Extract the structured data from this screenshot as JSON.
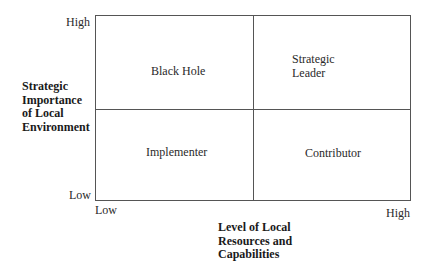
{
  "y_axis": {
    "high": "High",
    "low": "Low",
    "title_lines": [
      "Strategic",
      "Importance",
      "of Local",
      "Environment"
    ]
  },
  "x_axis": {
    "low": "Low",
    "high": "High",
    "title_lines": [
      "Level of Local",
      "Resources and",
      "Capabilities"
    ]
  },
  "quadrants": {
    "top_left": {
      "lines": [
        "Black Hole"
      ]
    },
    "top_right": {
      "lines": [
        "Strategic",
        "Leader"
      ]
    },
    "bottom_left": {
      "lines": [
        "Implementer"
      ]
    },
    "bottom_right": {
      "lines": [
        "Contributor"
      ]
    }
  },
  "colors": {
    "line": "#555555",
    "text": "#2a2a2a",
    "background": "#ffffff"
  }
}
